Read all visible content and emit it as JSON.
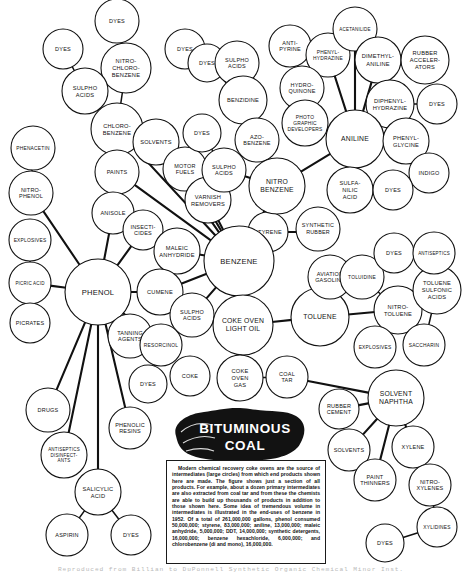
{
  "figure": {
    "center_label_line1": "BITUMINOUS",
    "center_label_line2": "COAL",
    "credit": "Reproduced from Billian to DuPonnell   Synthetic Organic Chemical Minor   Inst."
  },
  "infobox": {
    "text": "Modern chemical recovery coke ovens are the source of intermediates (large circles) from which end products shown here are made. The figure shows just a section of all products. For example, about a dozen primary intermediates are also extracted from coal tar and from these the chemists are able to build up thousands of products in addition to those shown here. Some idea of tremendous volume in intermediates is illustrated in the end-uses of benzene in 1952. Of a total of 261,000,000 gallons, phenol consumed 50,000,000; styrene, 83,000,000; aniline, 13,000,000; maleic anhydride, 5,000,000; DDT, 14,000,000; synthetic detergents, 16,000,000; benzene hexachloride, 6,000,000; and chlorobenzene (di and mono), 16,000,000."
  },
  "chart_data": {
    "type": "diagram",
    "nodes": [
      {
        "id": "dyes1",
        "label": "DYES",
        "x": 117,
        "y": 21,
        "r": 22,
        "size": "small"
      },
      {
        "id": "dyes2",
        "label": "DYES",
        "x": 63,
        "y": 49,
        "r": 20,
        "size": "small"
      },
      {
        "id": "nitrochlorobenzene",
        "label": "NITRO-\nCHLORO-\nBENZENE",
        "x": 126,
        "y": 68,
        "r": 25,
        "size": "small"
      },
      {
        "id": "sulphoacids1",
        "label": "SULPHO\nACIDS",
        "x": 85,
        "y": 91,
        "r": 23,
        "size": "small"
      },
      {
        "id": "chlorobenzene",
        "label": "CHLORO-\nBENZENE",
        "x": 117,
        "y": 129,
        "r": 26,
        "size": "small"
      },
      {
        "id": "phenacetin",
        "label": "PHENACETIN",
        "x": 33,
        "y": 148,
        "r": 22,
        "size": "small"
      },
      {
        "id": "nitrophenol",
        "label": "NITRO-\nPHENOL",
        "x": 31,
        "y": 193,
        "r": 22,
        "size": "small"
      },
      {
        "id": "paints",
        "label": "PAINTS",
        "x": 117,
        "y": 172,
        "r": 22,
        "size": "small"
      },
      {
        "id": "solvents1",
        "label": "SOLVENTS",
        "x": 156,
        "y": 142,
        "r": 23,
        "size": "small"
      },
      {
        "id": "motorfuels",
        "label": "MOTOR\nFUELS",
        "x": 185,
        "y": 169,
        "r": 22,
        "size": "small"
      },
      {
        "id": "varnishremovers",
        "label": "VARNISH\nREMOVERS",
        "x": 208,
        "y": 200,
        "r": 23,
        "size": "small"
      },
      {
        "id": "dyes3",
        "label": "DYES",
        "x": 185,
        "y": 49,
        "r": 20,
        "size": "small"
      },
      {
        "id": "dyes4",
        "label": "DYES",
        "x": 207,
        "y": 63,
        "r": 19,
        "size": "small"
      },
      {
        "id": "sulphoacids2",
        "label": "SULPHO\nACIDS",
        "x": 237,
        "y": 63,
        "r": 22,
        "size": "small"
      },
      {
        "id": "dyes5",
        "label": "DYES",
        "x": 202,
        "y": 133,
        "r": 19,
        "size": "small"
      },
      {
        "id": "benzidine",
        "label": "BENZIDINE",
        "x": 243,
        "y": 100,
        "r": 24,
        "size": "small"
      },
      {
        "id": "azobenzene",
        "label": "AZO-\nBENZENE",
        "x": 257,
        "y": 140,
        "r": 22,
        "size": "small"
      },
      {
        "id": "sulphoacids3",
        "label": "SULPHO\nACIDS",
        "x": 224,
        "y": 170,
        "r": 22,
        "size": "small"
      },
      {
        "id": "nitrobenzene",
        "label": "NITRO\nBENZENE",
        "x": 277,
        "y": 186,
        "r": 28,
        "size": "medium"
      },
      {
        "id": "antipyrine",
        "label": "ANTI-\nPYRINE",
        "x": 290,
        "y": 46,
        "r": 21,
        "size": "small"
      },
      {
        "id": "phenylhydrazine",
        "label": "PHENYL-\nHYDRAZINE",
        "x": 328,
        "y": 55,
        "r": 22,
        "size": "small"
      },
      {
        "id": "acetanilide",
        "label": "ACETANILIDE",
        "x": 355,
        "y": 29,
        "r": 22,
        "size": "small"
      },
      {
        "id": "dimethylaniline",
        "label": "DIMETHYL-\nANILINE",
        "x": 378,
        "y": 60,
        "r": 23,
        "size": "small"
      },
      {
        "id": "rubberaccelerators",
        "label": "RUBBER\nACCELER-\nATORS",
        "x": 425,
        "y": 60,
        "r": 24,
        "size": "small"
      },
      {
        "id": "hydroquinone",
        "label": "HYDRO-\nQUINONE",
        "x": 302,
        "y": 88,
        "r": 22,
        "size": "small"
      },
      {
        "id": "photographicdevelopers",
        "label": "PHOTO\nGRAPHIC\nDEVELOPERS",
        "x": 305,
        "y": 123,
        "r": 23,
        "size": "small"
      },
      {
        "id": "diphenylhydrazine",
        "label": "DIPHENYL-\nHYDRAZINE",
        "x": 390,
        "y": 104,
        "r": 24,
        "size": "small"
      },
      {
        "id": "dyes6",
        "label": "DYES",
        "x": 437,
        "y": 104,
        "r": 20,
        "size": "small"
      },
      {
        "id": "aniline",
        "label": "ANILINE",
        "x": 355,
        "y": 139,
        "r": 29,
        "size": "medium"
      },
      {
        "id": "phenylglycine",
        "label": "PHENYL-\nGLYCINE",
        "x": 406,
        "y": 141,
        "r": 23,
        "size": "small"
      },
      {
        "id": "indigo",
        "label": "INDIGO",
        "x": 429,
        "y": 173,
        "r": 20,
        "size": "small"
      },
      {
        "id": "sulfanilicacid",
        "label": "SULFA-\nNILIC\nACID",
        "x": 350,
        "y": 190,
        "r": 23,
        "size": "small"
      },
      {
        "id": "dyes7",
        "label": "DYES",
        "x": 393,
        "y": 190,
        "r": 20,
        "size": "small"
      },
      {
        "id": "anisole",
        "label": "ANISOLE",
        "x": 113,
        "y": 213,
        "r": 21,
        "size": "small"
      },
      {
        "id": "insecticides",
        "label": "INSECTI-\nCIDES",
        "x": 143,
        "y": 230,
        "r": 20,
        "size": "small"
      },
      {
        "id": "maleicanhydride",
        "label": "MALEIC\nANHYDRIDE",
        "x": 177,
        "y": 251,
        "r": 23,
        "size": "small"
      },
      {
        "id": "explosives1",
        "label": "EXPLOSIVES",
        "x": 30,
        "y": 240,
        "r": 21,
        "size": "small"
      },
      {
        "id": "picricacid",
        "label": "PICRIC ACID",
        "x": 30,
        "y": 283,
        "r": 21,
        "size": "small"
      },
      {
        "id": "picrates",
        "label": "PICRATES",
        "x": 30,
        "y": 323,
        "r": 20,
        "size": "small"
      },
      {
        "id": "phenol",
        "label": "PHENOL",
        "x": 98,
        "y": 292,
        "r": 33,
        "size": "large"
      },
      {
        "id": "cumene",
        "label": "CUMENE",
        "x": 160,
        "y": 292,
        "r": 23,
        "size": "small"
      },
      {
        "id": "benzene",
        "label": "BENZENE",
        "x": 239,
        "y": 261,
        "r": 35,
        "size": "large"
      },
      {
        "id": "styrene",
        "label": "STYRENE",
        "x": 242,
        "y": 232,
        "r": 1,
        "size": "hidden"
      },
      {
        "id": "tanningagents",
        "label": "TANNING\nAGENTS",
        "x": 130,
        "y": 336,
        "r": 22,
        "size": "small"
      },
      {
        "id": "sulphoacids4",
        "label": "SULPHO\nACIDS",
        "x": 192,
        "y": 315,
        "r": 22,
        "size": "small"
      },
      {
        "id": "resorcinol",
        "label": "RESORCINOL",
        "x": 161,
        "y": 345,
        "r": 21,
        "size": "small"
      },
      {
        "id": "dyes8",
        "label": "DYES",
        "x": 148,
        "y": 384,
        "r": 19,
        "size": "small"
      },
      {
        "id": "coke",
        "label": "COKE",
        "x": 190,
        "y": 376,
        "r": 20,
        "size": "small"
      },
      {
        "id": "cokeovenlightoil",
        "label": "COKE OVEN\nLIGHT OIL",
        "x": 243,
        "y": 325,
        "r": 30,
        "size": "medium"
      },
      {
        "id": "cokeovengas",
        "label": "COKE\nOVEN\nGAS",
        "x": 240,
        "y": 378,
        "r": 23,
        "size": "small"
      },
      {
        "id": "coaltar",
        "label": "COAL\nTAR",
        "x": 287,
        "y": 377,
        "r": 21,
        "size": "small"
      },
      {
        "id": "toluene",
        "label": "TOLUENE",
        "x": 320,
        "y": 317,
        "r": 29,
        "size": "medium"
      },
      {
        "id": "aviationgasoline",
        "label": "AVIATION\nGASOLINE",
        "x": 330,
        "y": 277,
        "r": 22,
        "size": "small"
      },
      {
        "id": "toluidine",
        "label": "TOLUIDINE",
        "x": 362,
        "y": 277,
        "r": 22,
        "size": "small"
      },
      {
        "id": "dyes9",
        "label": "DYES",
        "x": 394,
        "y": 253,
        "r": 20,
        "size": "small"
      },
      {
        "id": "nitrotoluene",
        "label": "NITRO-\nTOLUENE",
        "x": 398,
        "y": 310,
        "r": 24,
        "size": "small"
      },
      {
        "id": "toluenesulfonicacids",
        "label": "TOLUENE\nSULFONIC\nACIDS",
        "x": 437,
        "y": 290,
        "r": 24,
        "size": "small"
      },
      {
        "id": "antiseptics",
        "label": "ANTISEPTICS",
        "x": 434,
        "y": 253,
        "r": 21,
        "size": "small"
      },
      {
        "id": "saccharin",
        "label": "SACCHARIN",
        "x": 424,
        "y": 345,
        "r": 21,
        "size": "small"
      },
      {
        "id": "explosives2",
        "label": "EXPLOSIVES",
        "x": 375,
        "y": 347,
        "r": 21,
        "size": "small"
      },
      {
        "id": "solventnaphtha",
        "label": "SOLVENT\nNAPHTHA",
        "x": 396,
        "y": 398,
        "r": 28,
        "size": "medium"
      },
      {
        "id": "rubbercement",
        "label": "RUBBER\nCEMENT",
        "x": 339,
        "y": 409,
        "r": 20,
        "size": "small"
      },
      {
        "id": "solvents2",
        "label": "SOLVENTS",
        "x": 349,
        "y": 450,
        "r": 21,
        "size": "small"
      },
      {
        "id": "paintthinners",
        "label": "PAINT\nTHINNERS",
        "x": 375,
        "y": 480,
        "r": 21,
        "size": "small"
      },
      {
        "id": "xylene",
        "label": "XYLENE",
        "x": 413,
        "y": 447,
        "r": 21,
        "size": "small"
      },
      {
        "id": "nitroxylenes",
        "label": "NITRO-\nXYLENES",
        "x": 430,
        "y": 485,
        "r": 21,
        "size": "small"
      },
      {
        "id": "xylidines",
        "label": "XYLIDINES",
        "x": 437,
        "y": 527,
        "r": 20,
        "size": "small"
      },
      {
        "id": "dyes10",
        "label": "DYES",
        "x": 385,
        "y": 543,
        "r": 19,
        "size": "small"
      },
      {
        "id": "drugs",
        "label": "DRUGS",
        "x": 48,
        "y": 410,
        "r": 22,
        "size": "small"
      },
      {
        "id": "antisepticsdisinfectants",
        "label": "ANTISEPTICS\nDISINFECT-\nANTS",
        "x": 64,
        "y": 455,
        "r": 23,
        "size": "small"
      },
      {
        "id": "phenolicresins",
        "label": "PHENOLIC\nRESINS",
        "x": 130,
        "y": 428,
        "r": 21,
        "size": "small"
      },
      {
        "id": "salicylicacid",
        "label": "SALICYLIC\nACID",
        "x": 98,
        "y": 492,
        "r": 23,
        "size": "small"
      },
      {
        "id": "aspirin",
        "label": "ASPIRIN",
        "x": 67,
        "y": 535,
        "r": 21,
        "size": "small"
      },
      {
        "id": "dyes11",
        "label": "DYES",
        "x": 131,
        "y": 535,
        "r": 20,
        "size": "small"
      }
    ],
    "edges": [
      [
        "dyes1",
        "nitrochlorobenzene"
      ],
      [
        "dyes2",
        "sulphoacids1"
      ],
      [
        "nitrochlorobenzene",
        "chlorobenzene"
      ],
      [
        "sulphoacids1",
        "chlorobenzene"
      ],
      [
        "phenacetin",
        "nitrophenol"
      ],
      [
        "nitrophenol",
        "phenol"
      ],
      [
        "chlorobenzene",
        "benzene"
      ],
      [
        "paints",
        "benzene"
      ],
      [
        "solvents1",
        "benzene"
      ],
      [
        "motorfuels",
        "benzene"
      ],
      [
        "varnishremovers",
        "benzene"
      ],
      [
        "dyes3",
        "sulphoacids2"
      ],
      [
        "dyes4",
        "benzidine"
      ],
      [
        "sulphoacids2",
        "benzidine"
      ],
      [
        "benzidine",
        "azobenzene"
      ],
      [
        "dyes5",
        "sulphoacids3"
      ],
      [
        "azobenzene",
        "nitrobenzene"
      ],
      [
        "sulphoacids3",
        "nitrobenzene"
      ],
      [
        "nitrobenzene",
        "benzene"
      ],
      [
        "nitrobenzene",
        "aniline"
      ],
      [
        "antipyrine",
        "phenylhydrazine"
      ],
      [
        "phenylhydrazine",
        "aniline"
      ],
      [
        "acetanilide",
        "aniline"
      ],
      [
        "dimethylaniline",
        "aniline"
      ],
      [
        "dimethylaniline",
        "rubberaccelerators"
      ],
      [
        "hydroquinone",
        "photographicdevelopers"
      ],
      [
        "photographicdevelopers",
        "aniline"
      ],
      [
        "diphenylhydrazine",
        "dyes6"
      ],
      [
        "diphenylhydrazine",
        "aniline"
      ],
      [
        "aniline",
        "phenylglycine"
      ],
      [
        "phenylglycine",
        "indigo"
      ],
      [
        "aniline",
        "sulfanilicacid"
      ],
      [
        "sulfanilicacid",
        "dyes7"
      ],
      [
        "anisole",
        "phenol"
      ],
      [
        "insecticides",
        "phenol"
      ],
      [
        "maleicanhydride",
        "benzene"
      ],
      [
        "explosives1",
        "picricacid"
      ],
      [
        "picricacid",
        "picrates"
      ],
      [
        "picricacid",
        "phenol"
      ],
      [
        "phenol",
        "cumene"
      ],
      [
        "cumene",
        "benzene"
      ],
      [
        "phenol",
        "tanningagents"
      ],
      [
        "phenol",
        "resorcinol"
      ],
      [
        "sulphoacids4",
        "benzene"
      ],
      [
        "sulphoacids4",
        "resorcinol"
      ],
      [
        "resorcinol",
        "dyes8"
      ],
      [
        "benzene",
        "cokeovenlightoil"
      ],
      [
        "cokeovenlightoil",
        "cokeovengas"
      ],
      [
        "cokeovengas",
        "coaltar"
      ],
      [
        "cokeovenlightoil",
        "toluene"
      ],
      [
        "toluene",
        "aviationgasoline"
      ],
      [
        "toluene",
        "nitrotoluene"
      ],
      [
        "toluidine",
        "nitrotoluene"
      ],
      [
        "dyes9",
        "toluidine"
      ],
      [
        "nitrotoluene",
        "toluenesulfonicacids"
      ],
      [
        "toluenesulfonicacids",
        "antiseptics"
      ],
      [
        "toluenesulfonicacids",
        "saccharin"
      ],
      [
        "nitrotoluene",
        "explosives2"
      ],
      [
        "coaltar",
        "solventnaphtha"
      ],
      [
        "solventnaphtha",
        "rubbercement"
      ],
      [
        "solventnaphtha",
        "solvents2"
      ],
      [
        "solventnaphtha",
        "paintthinners"
      ],
      [
        "solventnaphtha",
        "xylene"
      ],
      [
        "xylene",
        "nitroxylenes"
      ],
      [
        "nitroxylenes",
        "xylidines"
      ],
      [
        "xylidines",
        "dyes10"
      ],
      [
        "phenol",
        "drugs"
      ],
      [
        "phenol",
        "antisepticsdisinfectants"
      ],
      [
        "phenol",
        "phenolicresins"
      ],
      [
        "phenol",
        "salicylicacid"
      ],
      [
        "salicylicacid",
        "aspirin"
      ],
      [
        "salicylicacid",
        "dyes11"
      ]
    ]
  }
}
